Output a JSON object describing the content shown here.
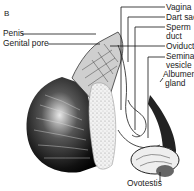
{
  "figure": {
    "panel_letter": "B",
    "labels_left": [
      "Penis",
      "Genital pore"
    ],
    "labels_right": [
      {
        "text": "Vagina"
      },
      {
        "text": "Dart sac"
      },
      {
        "text": "Sperm\nduct",
        "line1": "Sperm",
        "line2": "duct"
      },
      {
        "text": "Oviduct"
      },
      {
        "text": "Seminal\nvesicle",
        "line1": "Seminal",
        "line2": "vesicle"
      },
      {
        "text": "Albumen\ngland",
        "line1": "Albumen",
        "line2": "gland"
      }
    ],
    "labels_bottom": [
      "Ovotestis"
    ],
    "colors": {
      "ink": "#111111",
      "background": "#ffffff"
    }
  }
}
